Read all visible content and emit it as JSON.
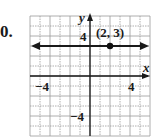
{
  "problem": {
    "number": "0."
  },
  "graph": {
    "x_axis_label": "x",
    "y_axis_label": "y",
    "x_range": [
      -6,
      6
    ],
    "y_range": [
      -6,
      6
    ],
    "grid_step": 1,
    "tick_labels": {
      "x_neg": "−4",
      "x_pos": "4",
      "y_neg": "−4",
      "y_pos": "4"
    },
    "line": {
      "type": "horizontal",
      "equation": "y = 3",
      "y": 3
    },
    "point": {
      "x": 2,
      "y": 3,
      "label": "(2, 3)"
    },
    "colors": {
      "grid": "#9a9a9a",
      "axis": "#1a1a1a",
      "line": "#1a1a1a",
      "point": "#111111"
    }
  }
}
